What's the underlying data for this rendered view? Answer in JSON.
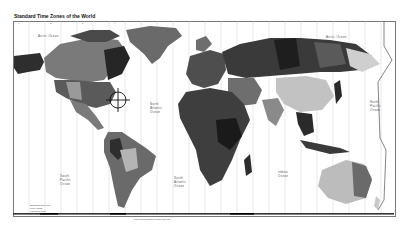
{
  "map": {
    "title": "Standard Time Zones of the World",
    "ocean_labels": [
      {
        "text": "Arctic Ocean",
        "x": 38,
        "y": 35
      },
      {
        "text": "Arctic Ocean",
        "x": 328,
        "y": 36
      },
      {
        "text": "North Atlantic Ocean",
        "x": 152,
        "y": 103
      },
      {
        "text": "North Pacific Ocean",
        "x": 372,
        "y": 100
      },
      {
        "text": "South Pacific Ocean",
        "x": 62,
        "y": 176
      },
      {
        "text": "South Atlantic Ocean",
        "x": 177,
        "y": 178
      },
      {
        "text": "Indian Ocean",
        "x": 280,
        "y": 172
      }
    ],
    "region_labels": [
      {
        "text": "Greenland",
        "x": 148,
        "y": 42
      },
      {
        "text": "Canada",
        "x": 78,
        "y": 76
      },
      {
        "text": "Alaska",
        "x": 30,
        "y": 64
      },
      {
        "text": "Russia",
        "x": 300,
        "y": 55
      },
      {
        "text": "China",
        "x": 305,
        "y": 110
      },
      {
        "text": "Australia",
        "x": 345,
        "y": 178
      },
      {
        "text": "Brazil",
        "x": 140,
        "y": 160
      }
    ],
    "top_ticks": [
      "1",
      "2",
      "3",
      "4",
      "5",
      "6",
      "7",
      "8",
      "9",
      "10",
      "11",
      "12"
    ],
    "bottom_ticks": [
      "-11",
      "-10",
      "-9",
      "-8",
      "-7",
      "-6",
      "-5",
      "-4",
      "-3",
      "-2",
      "-1",
      "0",
      "+1",
      "+2",
      "+3",
      "+4",
      "+5",
      "+6",
      "+7",
      "+8",
      "+9",
      "+10",
      "+11",
      "+12"
    ],
    "legend": {
      "lines": [
        "Standard time zone",
        "Time varies",
        "Half-hour zone"
      ],
      "note": "Time zones shown relative to UTC"
    },
    "colors": {
      "ocean": "#ffffff",
      "zone_dark": "#2a2a2a",
      "zone_mid": "#6e6e6e",
      "zone_light": "#a8a8a8",
      "zone_pale": "#d4d4d4",
      "gridline": "#bdbdbd"
    }
  }
}
